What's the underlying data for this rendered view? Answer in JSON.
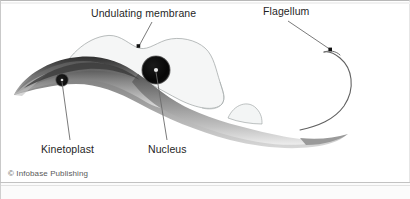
{
  "figure": {
    "background_color": "#ffffff",
    "border_color": "#c2c2c2"
  },
  "labels": {
    "undulating_membrane": "Undulating membrane",
    "flagellum": "Flagellum",
    "kinetoplast": "Kinetoplast",
    "nucleus": "Nucleus"
  },
  "credit": {
    "text": "© Infobase Publishing"
  },
  "structures": {
    "body": {
      "name": "cell-body",
      "fill_dark": "#3f3f3f",
      "fill_mid": "#8e8e8e",
      "fill_light": "#d6d6d6"
    },
    "nucleus": {
      "fill": "#0d0d0d",
      "rim": "#555555"
    },
    "kinetoplast": {
      "fill": "#111111",
      "rim": "#606060"
    },
    "undulating_membrane": {
      "fill": "#f4f6f6",
      "stroke": "#9aa0a0"
    },
    "flagellum": {
      "stroke": "#5a5a5a"
    }
  },
  "leaders": {
    "dot_color": "#111111",
    "line_color": "#6b6b6b"
  }
}
